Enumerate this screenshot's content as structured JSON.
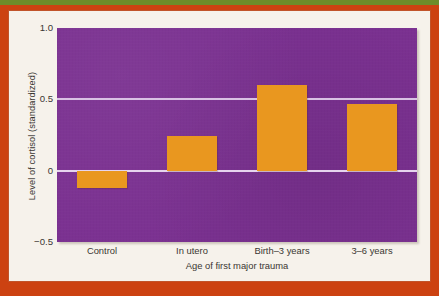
{
  "frame": {
    "border_color": "#cc4211",
    "accent_strip_color": "#6d8c2a",
    "card_color": "#f6f2eb"
  },
  "chart_data": {
    "type": "bar",
    "title": "",
    "subtitle": "",
    "xlabel": "Age of first major trauma",
    "ylabel": "Level of cortisol (standardized)",
    "categories": [
      "Control",
      "In utero",
      "Birth–3 years",
      "3–6 years"
    ],
    "values": [
      -0.12,
      0.24,
      0.6,
      0.47
    ],
    "ylim": [
      -0.5,
      1.0
    ],
    "yticks": [
      "1.0",
      "0.5",
      "0",
      "−0.5"
    ],
    "ytick_values": [
      1.0,
      0.5,
      0.0,
      -0.5
    ],
    "gridlines": [
      "0.5",
      "0"
    ],
    "grid": true,
    "legend": "none",
    "series": [
      {
        "name": "Level of cortisol (standardized)",
        "values": [
          -0.12,
          0.24,
          0.6,
          0.47
        ]
      }
    ],
    "colors": {
      "bar": "#e9971f",
      "plot_background": "#7b3191",
      "gridline": "#d9c2e4",
      "zeroline": "#e6d4ee",
      "text": "#3a3632"
    }
  }
}
